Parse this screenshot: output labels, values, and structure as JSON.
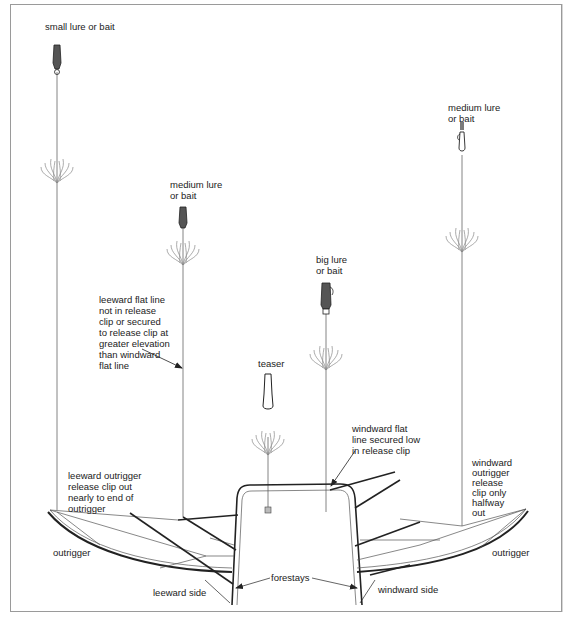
{
  "labels": {
    "small_lure": [
      "small lure or bait"
    ],
    "medium_lure_left": [
      "medium lure",
      "or bait"
    ],
    "medium_lure_right": [
      "medium lure",
      "or bait"
    ],
    "big_lure": [
      "big lure",
      "or bait"
    ],
    "teaser": [
      "teaser"
    ],
    "leeward_flat_line": [
      "leeward flat line",
      "not in release",
      "clip or secured",
      "to release clip at",
      "greater elevation",
      "than windward",
      "flat line"
    ],
    "windward_flat_line": [
      "windward flat",
      "line secured low",
      "in release clip"
    ],
    "leeward_outrigger_clip": [
      "leeward outrigger",
      "release clip out",
      "nearly to end of",
      "outrigger"
    ],
    "windward_outrigger_clip": [
      "windward",
      "outrigger",
      "release",
      "clip only",
      "halfway",
      "out"
    ],
    "outrigger_left": [
      "outrigger"
    ],
    "outrigger_right": [
      "outrigger"
    ],
    "forestays": [
      "forestays"
    ],
    "leeward_side": [
      "leeward side"
    ],
    "windward_side": [
      "windward side"
    ]
  },
  "icons": {
    "lure": "lure-icon",
    "teaser": "teaser-icon",
    "wake": "wake-splash-icon"
  }
}
